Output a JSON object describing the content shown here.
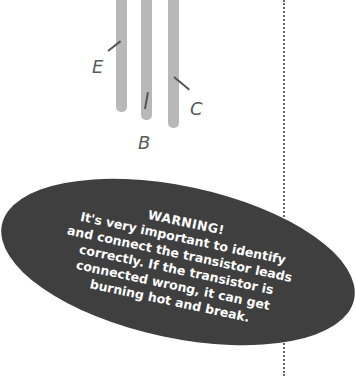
{
  "diagram": {
    "leads": [
      {
        "label": "E"
      },
      {
        "label": "B"
      },
      {
        "label": "C"
      }
    ],
    "lead_color": "#b8b8b8"
  },
  "warning": {
    "title": "WARNING!",
    "lines": [
      "It's very important to identify",
      "and connect the transistor leads",
      "correctly. If the transistor is",
      "connected wrong, it can get",
      "burning hot and break."
    ],
    "background_color": "#3f3f3f",
    "text_color": "#ffffff"
  }
}
